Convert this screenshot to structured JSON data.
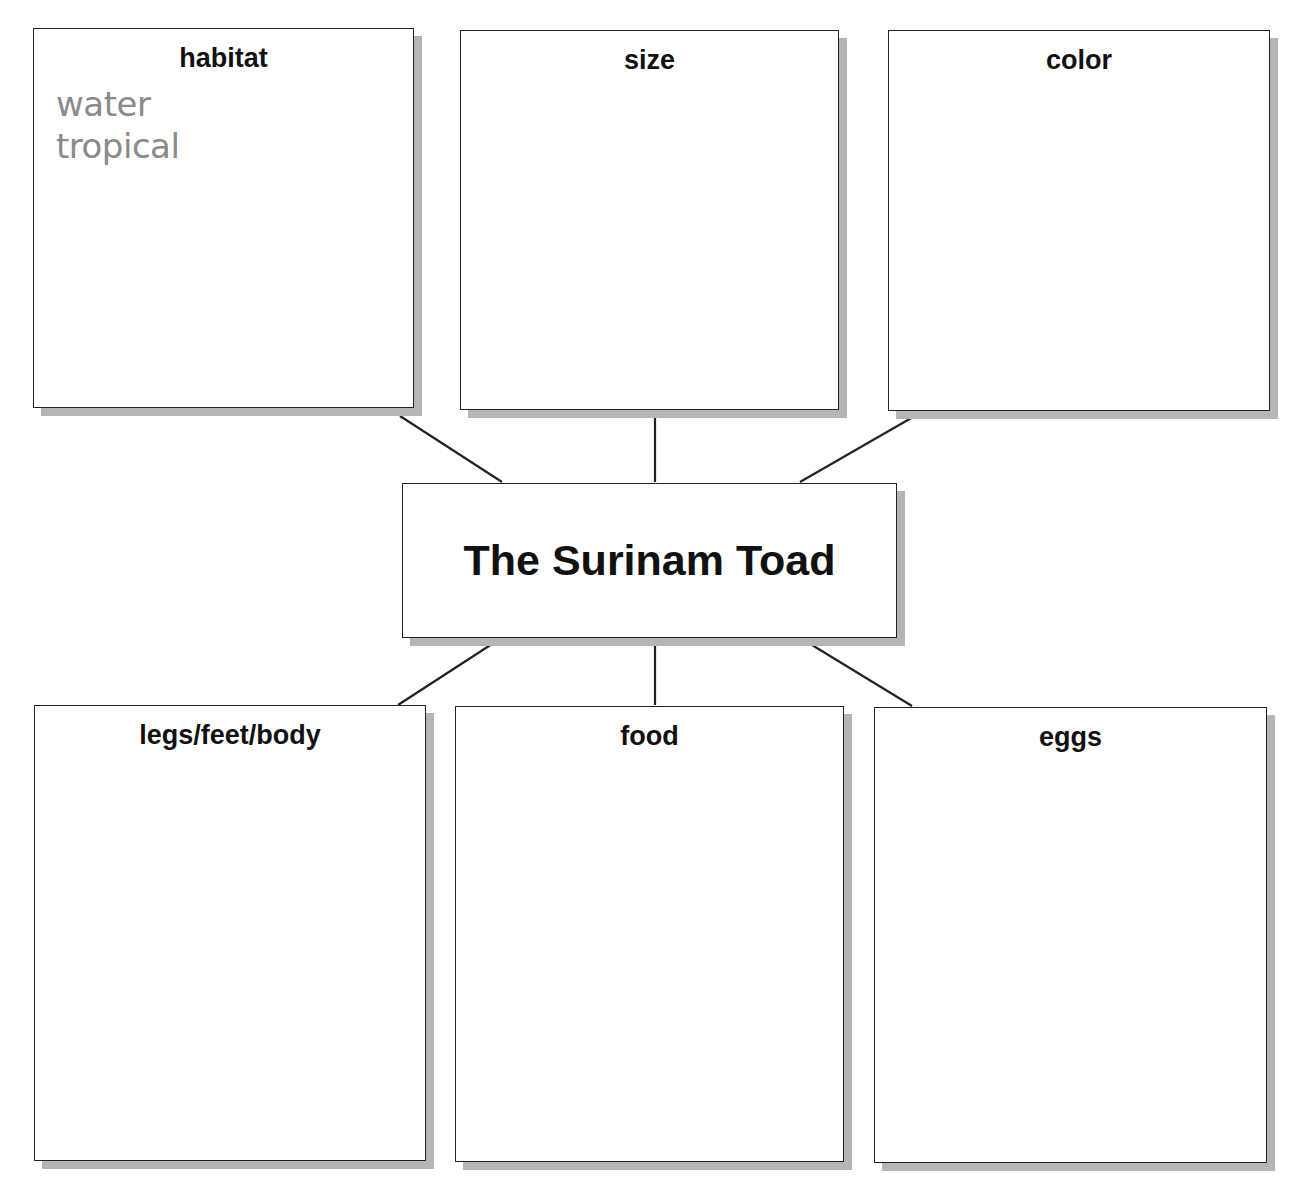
{
  "central_topic": "The Surinam Toad",
  "categories": [
    {
      "id": "habitat",
      "label": "habitat",
      "notes": [
        "water",
        "tropical"
      ]
    },
    {
      "id": "size",
      "label": "size",
      "notes": []
    },
    {
      "id": "color",
      "label": "color",
      "notes": []
    },
    {
      "id": "legs",
      "label": "legs/feet/body",
      "notes": []
    },
    {
      "id": "food",
      "label": "food",
      "notes": []
    },
    {
      "id": "eggs",
      "label": "eggs",
      "notes": []
    }
  ]
}
